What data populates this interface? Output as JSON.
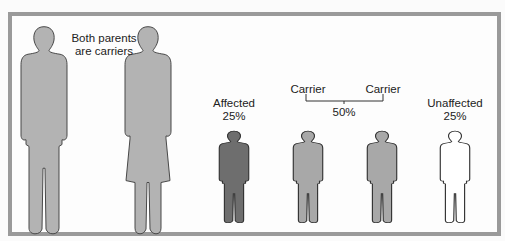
{
  "parents": {
    "label_line1": "Both parents",
    "label_line2": "are carriers"
  },
  "children": [
    {
      "label": "Affected",
      "percent": "25%",
      "fill": "#6e6e6e"
    },
    {
      "label": "Carrier",
      "fill": "#a8a8a8"
    },
    {
      "label": "Carrier",
      "fill": "#a8a8a8"
    },
    {
      "label": "Unaffected",
      "percent": "25%",
      "fill": "#ffffff"
    }
  ],
  "carrier_group": {
    "percent": "50%"
  },
  "colors": {
    "parent": "#b3b3b3",
    "affected": "#6e6e6e",
    "carrier": "#a8a8a8",
    "unaffected": "#ffffff",
    "border": "#9a9a9a"
  }
}
